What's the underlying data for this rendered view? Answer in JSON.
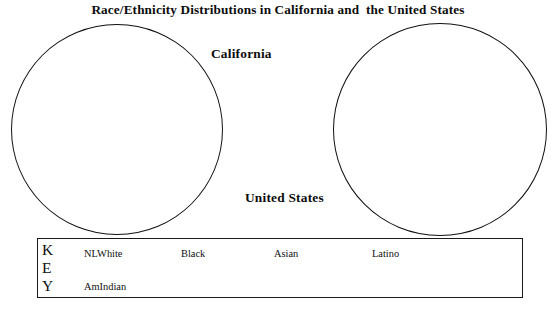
{
  "document": {
    "title": "Race/Ethnicity Distributions in California and  the United States"
  },
  "chart_data": {
    "type": "pie",
    "title": "Race/Ethnicity Distributions in California and  the United States",
    "subtitle": "",
    "note": "Blank worksheet template: two empty pie-chart outlines with no wedges drawn and no numeric values printed.",
    "legend_position": "bottom",
    "grid": false,
    "charts": [
      {
        "name": "California",
        "label": "California",
        "categories": [
          "NLWhite",
          "Black",
          "Asian",
          "Latino",
          "AmIndian"
        ],
        "values": [
          null,
          null,
          null,
          null,
          null
        ]
      },
      {
        "name": "United States",
        "label": "United States",
        "categories": [
          "NLWhite",
          "Black",
          "Asian",
          "Latino",
          "AmIndian"
        ],
        "values": [
          null,
          null,
          null,
          null,
          null
        ]
      }
    ],
    "legend": [
      {
        "label": "NLWhite"
      },
      {
        "label": "Black"
      },
      {
        "label": "Asian"
      },
      {
        "label": "Latino"
      },
      {
        "label": "AmIndian"
      }
    ],
    "colors": {
      "stroke": "#111111",
      "fill": "#ffffff",
      "background": "#ffffff",
      "text": "#0d0d0d"
    }
  },
  "pies": {
    "california": {
      "label": "California"
    },
    "united_states": {
      "label": "United States"
    }
  },
  "legend": {
    "key_letters": [
      "K",
      "E",
      "Y"
    ],
    "key_word": "KEY",
    "items": [
      {
        "label": "NLWhite"
      },
      {
        "label": "Black"
      },
      {
        "label": "Asian"
      },
      {
        "label": "Latino"
      },
      {
        "label": "AmIndian"
      }
    ]
  }
}
